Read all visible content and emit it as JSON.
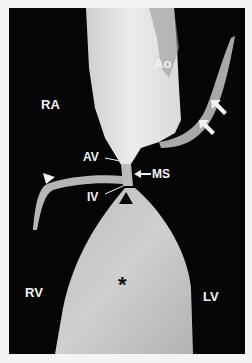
{
  "figure": {
    "labels": {
      "ao": "Ao",
      "ra": "RA",
      "av": "AV",
      "ms": "MS",
      "iv": "IV",
      "rv": "RV",
      "lv": "LV",
      "asterisk": "*"
    },
    "markers": [
      {
        "type": "white-arrow",
        "count": 2,
        "location": "right upper leaflet"
      },
      {
        "type": "white-arrowhead",
        "location": "left tricuspid leaflet"
      },
      {
        "type": "black-arrowhead",
        "location": "septal crest"
      },
      {
        "type": "arrow",
        "label": "MS"
      }
    ],
    "colors": {
      "background": "#050505",
      "border": "#f4f4f4",
      "tissue_light": "#e6e6e6",
      "tissue_mid": "#bdbdbd",
      "label": "#f2f2f2"
    }
  }
}
